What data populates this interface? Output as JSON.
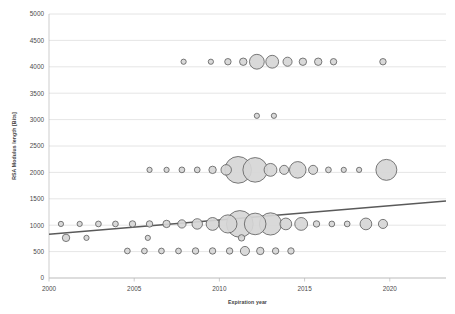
{
  "chart_data": {
    "type": "scatter",
    "title": "",
    "xlabel": "Expiration year",
    "ylabel": "RSA Modulus length [Bits]",
    "xlim": [
      2000,
      2023.3
    ],
    "ylim": [
      0,
      5000
    ],
    "grid": true,
    "legend": "none",
    "xticks": [
      2000,
      2005,
      2010,
      2015,
      2020
    ],
    "xtick_labels": [
      "2000",
      "2005",
      "2010",
      "2015",
      "2020"
    ],
    "yticks": [
      0,
      500,
      1000,
      1500,
      2000,
      2500,
      3000,
      3500,
      4000,
      4500,
      5000
    ],
    "ytick_labels": [
      "0",
      "500",
      "1000",
      "1500",
      "2000",
      "2500",
      "3000",
      "3500",
      "4000",
      "4500",
      "5000"
    ],
    "bubble_fill": "#d6d6d6",
    "bubble_stroke": "#5a5a5a",
    "trendline_color": "#5a5a5a",
    "trendline": {
      "x0": 2000,
      "y0": 830,
      "x1": 2023.3,
      "y1": 1460
    },
    "series": [
      {
        "name": "4096",
        "points": [
          {
            "x": 2007.9,
            "y": 4096,
            "size": 1
          },
          {
            "x": 2009.5,
            "y": 4096,
            "size": 1
          },
          {
            "x": 2010.5,
            "y": 4096,
            "size": 1.5
          },
          {
            "x": 2011.4,
            "y": 4096,
            "size": 2
          },
          {
            "x": 2012.2,
            "y": 4096,
            "size": 8
          },
          {
            "x": 2013.1,
            "y": 4096,
            "size": 6
          },
          {
            "x": 2014.0,
            "y": 4096,
            "size": 3
          },
          {
            "x": 2014.9,
            "y": 4096,
            "size": 2
          },
          {
            "x": 2015.8,
            "y": 4096,
            "size": 2
          },
          {
            "x": 2016.7,
            "y": 4096,
            "size": 1.5
          },
          {
            "x": 2019.6,
            "y": 4096,
            "size": 1.5
          }
        ]
      },
      {
        "name": "3072",
        "points": [
          {
            "x": 2012.2,
            "y": 3072,
            "size": 1
          },
          {
            "x": 2013.2,
            "y": 3072,
            "size": 1
          }
        ]
      },
      {
        "name": "2048",
        "points": [
          {
            "x": 2005.9,
            "y": 2048,
            "size": 1
          },
          {
            "x": 2006.9,
            "y": 2048,
            "size": 1
          },
          {
            "x": 2007.8,
            "y": 2048,
            "size": 1.2
          },
          {
            "x": 2008.7,
            "y": 2048,
            "size": 1.2
          },
          {
            "x": 2009.6,
            "y": 2048,
            "size": 2
          },
          {
            "x": 2010.4,
            "y": 2048,
            "size": 4
          },
          {
            "x": 2011.1,
            "y": 2048,
            "size": 26
          },
          {
            "x": 2012.1,
            "y": 2048,
            "size": 22
          },
          {
            "x": 2013.0,
            "y": 2048,
            "size": 6
          },
          {
            "x": 2013.8,
            "y": 2048,
            "size": 3
          },
          {
            "x": 2014.6,
            "y": 2048,
            "size": 10
          },
          {
            "x": 2015.5,
            "y": 2048,
            "size": 3
          },
          {
            "x": 2016.4,
            "y": 2048,
            "size": 1.2
          },
          {
            "x": 2017.3,
            "y": 2048,
            "size": 1
          },
          {
            "x": 2018.2,
            "y": 2048,
            "size": 1
          },
          {
            "x": 2019.8,
            "y": 2048,
            "size": 16
          }
        ]
      },
      {
        "name": "1024",
        "points": [
          {
            "x": 2000.7,
            "y": 1024,
            "size": 1
          },
          {
            "x": 2001.8,
            "y": 1024,
            "size": 1
          },
          {
            "x": 2002.9,
            "y": 1024,
            "size": 1.2
          },
          {
            "x": 2003.9,
            "y": 1024,
            "size": 1.2
          },
          {
            "x": 2004.9,
            "y": 1024,
            "size": 1.5
          },
          {
            "x": 2005.9,
            "y": 1024,
            "size": 1.5
          },
          {
            "x": 2006.9,
            "y": 1024,
            "size": 2
          },
          {
            "x": 2007.8,
            "y": 1024,
            "size": 2.5
          },
          {
            "x": 2008.7,
            "y": 1024,
            "size": 4
          },
          {
            "x": 2009.6,
            "y": 1024,
            "size": 6
          },
          {
            "x": 2010.5,
            "y": 1024,
            "size": 12
          },
          {
            "x": 2011.2,
            "y": 1024,
            "size": 26
          },
          {
            "x": 2012.1,
            "y": 1024,
            "size": 17
          },
          {
            "x": 2013.0,
            "y": 1024,
            "size": 18
          },
          {
            "x": 2013.9,
            "y": 1024,
            "size": 5
          },
          {
            "x": 2014.8,
            "y": 1024,
            "size": 6
          },
          {
            "x": 2015.7,
            "y": 1024,
            "size": 1.5
          },
          {
            "x": 2016.6,
            "y": 1024,
            "size": 1.2
          },
          {
            "x": 2017.5,
            "y": 1024,
            "size": 1.2
          },
          {
            "x": 2018.6,
            "y": 1024,
            "size": 5
          },
          {
            "x": 2019.6,
            "y": 1024,
            "size": 3
          }
        ]
      },
      {
        "name": "768",
        "points": [
          {
            "x": 2001.0,
            "y": 760,
            "size": 2
          },
          {
            "x": 2002.2,
            "y": 760,
            "size": 1
          },
          {
            "x": 2005.8,
            "y": 760,
            "size": 1
          },
          {
            "x": 2011.3,
            "y": 760,
            "size": 1.5
          }
        ]
      },
      {
        "name": "512",
        "points": [
          {
            "x": 2004.6,
            "y": 512,
            "size": 1.2
          },
          {
            "x": 2005.6,
            "y": 512,
            "size": 1.2
          },
          {
            "x": 2006.6,
            "y": 512,
            "size": 1.2
          },
          {
            "x": 2007.6,
            "y": 512,
            "size": 1.2
          },
          {
            "x": 2008.6,
            "y": 512,
            "size": 1.5
          },
          {
            "x": 2009.6,
            "y": 512,
            "size": 1.5
          },
          {
            "x": 2010.6,
            "y": 512,
            "size": 1.5
          },
          {
            "x": 2011.5,
            "y": 512,
            "size": 3
          },
          {
            "x": 2012.4,
            "y": 512,
            "size": 2
          },
          {
            "x": 2013.3,
            "y": 512,
            "size": 1.5
          },
          {
            "x": 2014.2,
            "y": 512,
            "size": 1.5
          }
        ]
      }
    ]
  }
}
